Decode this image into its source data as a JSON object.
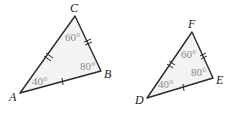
{
  "colors": {
    "stroke": "#2a2a2a",
    "fill": "#f3f3f3",
    "angle_text": "#8a8a8a",
    "vertex_text": "#222222"
  },
  "triangles": [
    {
      "name": "ABC",
      "vertices": [
        {
          "label": "A",
          "x": 20,
          "y": 93,
          "lx": 9,
          "ly": 101
        },
        {
          "label": "C",
          "x": 75,
          "y": 16,
          "lx": 70,
          "ly": 12
        },
        {
          "label": "B",
          "x": 101,
          "y": 71,
          "lx": 104,
          "ly": 78
        }
      ],
      "angles": [
        {
          "value": "40°",
          "x": 32,
          "y": 85
        },
        {
          "value": "60°",
          "x": 65,
          "y": 41
        },
        {
          "value": "80°",
          "x": 80,
          "y": 70
        }
      ]
    },
    {
      "name": "DEF",
      "vertices": [
        {
          "label": "D",
          "x": 147,
          "y": 98,
          "lx": 135,
          "ly": 104
        },
        {
          "label": "F",
          "x": 192,
          "y": 32,
          "lx": 188,
          "ly": 28
        },
        {
          "label": "E",
          "x": 213,
          "y": 78,
          "lx": 216,
          "ly": 84
        }
      ],
      "angles": [
        {
          "value": "40°",
          "x": 158,
          "y": 88
        },
        {
          "value": "60°",
          "x": 181,
          "y": 58
        },
        {
          "value": "80°",
          "x": 191,
          "y": 76
        }
      ]
    }
  ]
}
